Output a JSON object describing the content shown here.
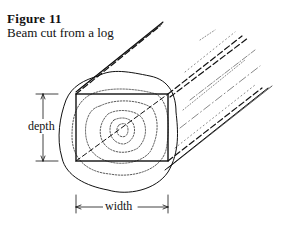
{
  "caption": {
    "figure_number": "Figure 11",
    "title": "Beam cut from a log"
  },
  "diagram": {
    "labels": {
      "depth": "depth",
      "width": "width"
    },
    "colors": {
      "ink": "#111111",
      "background": "#ffffff"
    }
  }
}
